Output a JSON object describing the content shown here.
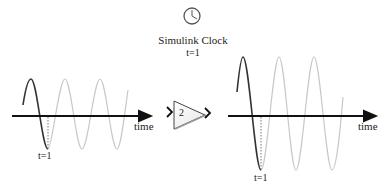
{
  "clock": {
    "icon": "clock-icon",
    "title": "Simulink Clock",
    "time_label": "t=1"
  },
  "input_plot": {
    "axis_label": "time",
    "marker_label": "t=1",
    "amplitude": 1,
    "colors": {
      "past": "#333333",
      "future": "#c8c8c8",
      "axis": "#111111"
    }
  },
  "gain_block": {
    "value": "2",
    "icon": "gain-triangle-icon"
  },
  "output_plot": {
    "axis_label": "time",
    "marker_label": "t=1",
    "amplitude": 2,
    "colors": {
      "past": "#333333",
      "future": "#c8c8c8",
      "axis": "#111111"
    }
  }
}
